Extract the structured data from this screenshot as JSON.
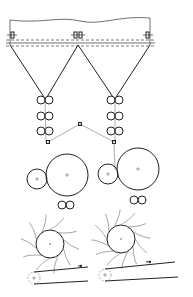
{
  "diagram": {
    "type": "technical-machine-schematic",
    "stroke_color": "#222222",
    "background": "#ffffff",
    "components": [
      {
        "name": "creel-frame",
        "kind": "frame"
      },
      {
        "name": "bobbin-left",
        "kind": "bobbin"
      },
      {
        "name": "bobbin-center",
        "kind": "bobbin-pair"
      },
      {
        "name": "bobbin-right",
        "kind": "bobbin"
      },
      {
        "name": "drafting-rollers-left",
        "kind": "roller-pairs",
        "count": 3
      },
      {
        "name": "drafting-rollers-right",
        "kind": "roller-pairs",
        "count": 3
      },
      {
        "name": "guide-rollers",
        "kind": "guide",
        "count": 3
      },
      {
        "name": "drum-left",
        "kind": "large-drum"
      },
      {
        "name": "drum-right",
        "kind": "large-drum"
      },
      {
        "name": "spiked-roller-left",
        "kind": "spiked-roller"
      },
      {
        "name": "spiked-roller-right",
        "kind": "spiked-roller"
      },
      {
        "name": "conveyor-left",
        "kind": "belt"
      },
      {
        "name": "conveyor-right",
        "kind": "belt"
      }
    ]
  }
}
